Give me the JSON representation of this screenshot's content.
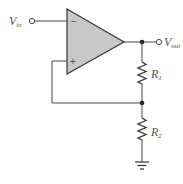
{
  "diagram": {
    "type": "circuit-schematic",
    "labels": {
      "vin": {
        "main": "V",
        "sub": "in"
      },
      "vout": {
        "main": "V",
        "sub": "out"
      },
      "r1": {
        "main": "R",
        "sub": "1"
      },
      "r2": {
        "main": "R",
        "sub": "2"
      },
      "inverting_input": "−",
      "noninverting_input": "+"
    },
    "colors": {
      "wire": "#4a4a4a",
      "opamp_fill": "#c8c8c8",
      "opamp_stroke": "#333333",
      "label": "#555555",
      "background": "#ffffff"
    },
    "components": [
      {
        "id": "opamp",
        "kind": "op-amp"
      },
      {
        "id": "R1",
        "kind": "resistor",
        "between": [
          "output-node",
          "feedback-node"
        ]
      },
      {
        "id": "R2",
        "kind": "resistor",
        "between": [
          "feedback-node",
          "ground"
        ]
      },
      {
        "id": "GND",
        "kind": "ground"
      }
    ]
  }
}
